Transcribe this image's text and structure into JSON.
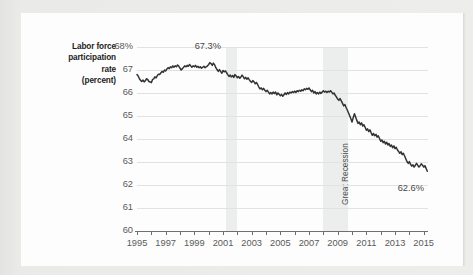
{
  "figure": {
    "y_axis_title_lines": [
      "Labor force",
      "participation",
      "rate",
      "(percent)"
    ],
    "annotations": {
      "peak": "67.3%",
      "latest": "62.6%",
      "recession_band": "Great Recession"
    }
  },
  "chart_data": {
    "type": "line",
    "title": "",
    "xlabel": "",
    "ylabel": "Labor force participation rate (percent)",
    "grid": true,
    "legend": null,
    "xlim": [
      1995.0,
      2015.3
    ],
    "ylim": [
      60,
      68
    ],
    "ytick_labels": [
      "68%",
      "67",
      "66",
      "65",
      "64",
      "63",
      "62",
      "61",
      "60"
    ],
    "yticks": [
      68,
      67,
      66,
      65,
      64,
      63,
      62,
      61,
      60
    ],
    "xtick_labels": [
      "1995",
      "1997",
      "1999",
      "2001",
      "2003",
      "2005",
      "2007",
      "2009",
      "2011",
      "2013",
      "2015"
    ],
    "xticks": [
      1995,
      1997,
      1999,
      2001,
      2003,
      2005,
      2007,
      2009,
      2011,
      2013,
      2015
    ],
    "minor_xticks": [
      1996,
      1998,
      2000,
      2002,
      2004,
      2006,
      2008,
      2010,
      2012,
      2014
    ],
    "line_color": "#333333",
    "band_color": "#eceded",
    "shaded_bands": [
      {
        "label": "",
        "x0": 2001.2,
        "x1": 2002.0
      },
      {
        "label": "Great Recession",
        "x0": 2007.95,
        "x1": 2009.75
      }
    ],
    "data_labels": [
      {
        "text": "67.3%",
        "x": 2000.0,
        "y": 67.3
      },
      {
        "text": "62.6%",
        "x": 2015.0,
        "y": 62.6
      }
    ],
    "series": [
      {
        "name": "Labor force participation rate",
        "x": [
          1995.0,
          1995.08,
          1995.17,
          1995.25,
          1995.33,
          1995.42,
          1995.5,
          1995.58,
          1995.67,
          1995.75,
          1995.83,
          1995.92,
          1996.0,
          1996.08,
          1996.17,
          1996.25,
          1996.33,
          1996.42,
          1996.5,
          1996.58,
          1996.67,
          1996.75,
          1996.83,
          1996.92,
          1997.0,
          1997.08,
          1997.17,
          1997.25,
          1997.33,
          1997.42,
          1997.5,
          1997.58,
          1997.67,
          1997.75,
          1997.83,
          1997.92,
          1998.0,
          1998.08,
          1998.17,
          1998.25,
          1998.33,
          1998.42,
          1998.5,
          1998.58,
          1998.67,
          1998.75,
          1998.83,
          1998.92,
          1999.0,
          1999.08,
          1999.17,
          1999.25,
          1999.33,
          1999.42,
          1999.5,
          1999.58,
          1999.67,
          1999.75,
          1999.83,
          1999.92,
          2000.0,
          2000.08,
          2000.17,
          2000.25,
          2000.33,
          2000.42,
          2000.5,
          2000.58,
          2000.67,
          2000.75,
          2000.83,
          2000.92,
          2001.0,
          2001.08,
          2001.17,
          2001.25,
          2001.33,
          2001.42,
          2001.5,
          2001.58,
          2001.67,
          2001.75,
          2001.83,
          2001.92,
          2002.0,
          2002.08,
          2002.17,
          2002.25,
          2002.33,
          2002.42,
          2002.5,
          2002.58,
          2002.67,
          2002.75,
          2002.83,
          2002.92,
          2003.0,
          2003.08,
          2003.17,
          2003.25,
          2003.33,
          2003.42,
          2003.5,
          2003.58,
          2003.67,
          2003.75,
          2003.83,
          2003.92,
          2004.0,
          2004.08,
          2004.17,
          2004.25,
          2004.33,
          2004.42,
          2004.5,
          2004.58,
          2004.67,
          2004.75,
          2004.83,
          2004.92,
          2005.0,
          2005.08,
          2005.17,
          2005.25,
          2005.33,
          2005.42,
          2005.5,
          2005.58,
          2005.67,
          2005.75,
          2005.83,
          2005.92,
          2006.0,
          2006.08,
          2006.17,
          2006.25,
          2006.33,
          2006.42,
          2006.5,
          2006.58,
          2006.67,
          2006.75,
          2006.83,
          2006.92,
          2007.0,
          2007.08,
          2007.17,
          2007.25,
          2007.33,
          2007.42,
          2007.5,
          2007.58,
          2007.67,
          2007.75,
          2007.83,
          2007.92,
          2008.0,
          2008.08,
          2008.17,
          2008.25,
          2008.33,
          2008.42,
          2008.5,
          2008.58,
          2008.67,
          2008.75,
          2008.83,
          2008.92,
          2009.0,
          2009.08,
          2009.17,
          2009.25,
          2009.33,
          2009.42,
          2009.5,
          2009.58,
          2009.67,
          2009.75,
          2009.83,
          2009.92,
          2010.0,
          2010.08,
          2010.17,
          2010.25,
          2010.33,
          2010.42,
          2010.5,
          2010.58,
          2010.67,
          2010.75,
          2010.83,
          2010.92,
          2011.0,
          2011.08,
          2011.17,
          2011.25,
          2011.33,
          2011.42,
          2011.5,
          2011.58,
          2011.67,
          2011.75,
          2011.83,
          2011.92,
          2012.0,
          2012.08,
          2012.17,
          2012.25,
          2012.33,
          2012.42,
          2012.5,
          2012.58,
          2012.67,
          2012.75,
          2012.83,
          2012.92,
          2013.0,
          2013.08,
          2013.17,
          2013.25,
          2013.33,
          2013.42,
          2013.5,
          2013.58,
          2013.67,
          2013.75,
          2013.83,
          2013.92,
          2014.0,
          2014.08,
          2014.17,
          2014.25,
          2014.33,
          2014.42,
          2014.5,
          2014.58,
          2014.67,
          2014.75,
          2014.83,
          2014.92,
          2015.0,
          2015.08,
          2015.17,
          2015.25
        ],
        "y": [
          66.8,
          66.74,
          66.62,
          66.55,
          66.5,
          66.56,
          66.48,
          66.53,
          66.62,
          66.58,
          66.5,
          66.48,
          66.45,
          66.58,
          66.62,
          66.7,
          66.66,
          66.76,
          66.82,
          66.8,
          66.88,
          66.94,
          66.9,
          67.0,
          66.96,
          67.04,
          67.1,
          67.06,
          67.14,
          67.1,
          67.18,
          67.12,
          67.18,
          67.14,
          67.22,
          67.16,
          67.08,
          67.0,
          67.06,
          67.12,
          67.18,
          67.14,
          67.2,
          67.16,
          67.24,
          67.18,
          67.12,
          67.18,
          67.14,
          67.2,
          67.12,
          67.16,
          67.1,
          67.14,
          67.08,
          67.12,
          67.16,
          67.1,
          67.14,
          67.18,
          67.24,
          67.32,
          67.28,
          67.2,
          67.3,
          67.22,
          67.1,
          67.02,
          66.94,
          67.02,
          66.94,
          66.86,
          66.98,
          66.92,
          66.96,
          66.88,
          66.8,
          66.72,
          66.78,
          66.7,
          66.76,
          66.68,
          66.8,
          66.74,
          66.66,
          66.72,
          66.64,
          66.7,
          66.78,
          66.7,
          66.62,
          66.68,
          66.6,
          66.66,
          66.58,
          66.5,
          66.46,
          66.54,
          66.48,
          66.4,
          66.46,
          66.36,
          66.26,
          66.18,
          66.22,
          66.14,
          66.2,
          66.12,
          66.06,
          66.12,
          66.04,
          65.96,
          66.02,
          65.96,
          66.04,
          65.98,
          66.04,
          65.92,
          66.0,
          65.94,
          65.88,
          65.94,
          65.86,
          65.92,
          66.0,
          65.94,
          66.02,
          65.96,
          66.04,
          66.0,
          66.06,
          66.02,
          66.08,
          66.02,
          66.1,
          66.06,
          66.12,
          66.08,
          66.14,
          66.1,
          66.18,
          66.14,
          66.2,
          66.16,
          66.22,
          66.14,
          66.06,
          66.12,
          66.0,
          66.06,
          65.96,
          66.02,
          65.96,
          66.04,
          65.98,
          66.04,
          66.1,
          66.04,
          66.08,
          66.02,
          66.08,
          66.04,
          66.1,
          66.04,
          65.96,
          66.0,
          65.9,
          65.82,
          65.74,
          65.68,
          65.76,
          65.66,
          65.56,
          65.44,
          65.5,
          65.38,
          65.26,
          65.14,
          65.02,
          64.88,
          64.74,
          64.92,
          65.1,
          64.96,
          64.82,
          64.68,
          64.74,
          64.62,
          64.7,
          64.56,
          64.62,
          64.5,
          64.38,
          64.44,
          64.32,
          64.4,
          64.28,
          64.16,
          64.24,
          64.14,
          64.2,
          64.08,
          64.14,
          64.02,
          63.9,
          63.96,
          63.84,
          63.9,
          63.78,
          63.86,
          63.74,
          63.8,
          63.68,
          63.74,
          63.62,
          63.7,
          63.58,
          63.64,
          63.52,
          63.46,
          63.38,
          63.44,
          63.32,
          63.38,
          63.26,
          63.14,
          63.02,
          62.94,
          63.02,
          62.9,
          62.82,
          62.88,
          62.78,
          62.86,
          62.94,
          62.86,
          62.78,
          62.84,
          62.92,
          62.86,
          62.78,
          62.84,
          62.72,
          62.6
        ]
      }
    ]
  }
}
